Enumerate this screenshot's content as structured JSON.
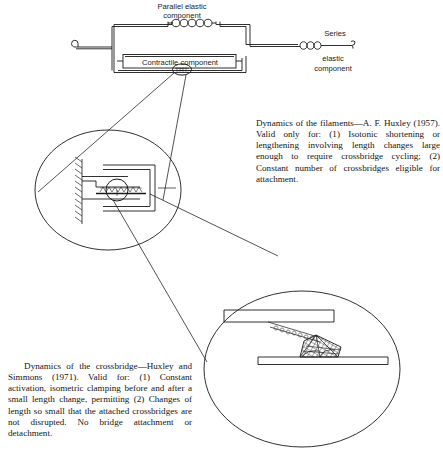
{
  "figure": {
    "ink_color": "#1a1a1a",
    "background_color": "#ffffff"
  },
  "model_diagram": {
    "name": "three-element-muscle-model",
    "labels": {
      "parallel_elastic_line1": "Parallel elastic",
      "parallel_elastic_line2": "component",
      "contractile": "Contractile   component",
      "series_line1": "Series",
      "series_line2": "elastic",
      "series_line3": "component"
    },
    "elements": {
      "parallel_spring_coils": 5,
      "series_spring_coils": 3,
      "left_hook": "hook-left",
      "right_hook": "hook-right"
    }
  },
  "filament_inset": {
    "name": "filament-sliding-inset",
    "shape": "ellipse",
    "features": [
      "hatched-wall",
      "thick-filament",
      "thin-filaments",
      "crossbridge-zigzag",
      "highlight-circle"
    ]
  },
  "crossbridge_inset": {
    "name": "crossbridge-detail-inset",
    "shape": "ellipse",
    "features": [
      "upper-filament",
      "lower-filament",
      "crossbridge-head",
      "crosshatched-bridge",
      "elastic-neck"
    ]
  },
  "captions": {
    "filaments": "Dynamics of the filaments—A. F. Huxley (1957). Valid only for: (1) Isotonic shortening or lengthening involving length changes large enough to require crossbridge cycling; (2) Constant number of crossbridges eligible for attachment.",
    "crossbridge": "   Dynamics of the crossbridge—Huxley and Simmons (1971). Valid for: (1) Constant activation, isometric clamping before and after a small length change, permitting (2) Changes of length so small that the attached crossbridges are not disrupted. No bridge attachment or detachment."
  }
}
